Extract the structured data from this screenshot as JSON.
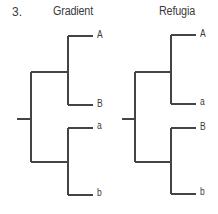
{
  "figure": {
    "panel_number": "3.",
    "line_color": "#444444",
    "trees": [
      {
        "title": "Gradient",
        "topology": "((A,B),(a,b))",
        "leaves": [
          "A",
          "B",
          "a",
          "b"
        ]
      },
      {
        "title": "Refugia",
        "topology": "((A,a),(B,b))",
        "leaves": [
          "A",
          "a",
          "B",
          "b"
        ]
      }
    ]
  }
}
